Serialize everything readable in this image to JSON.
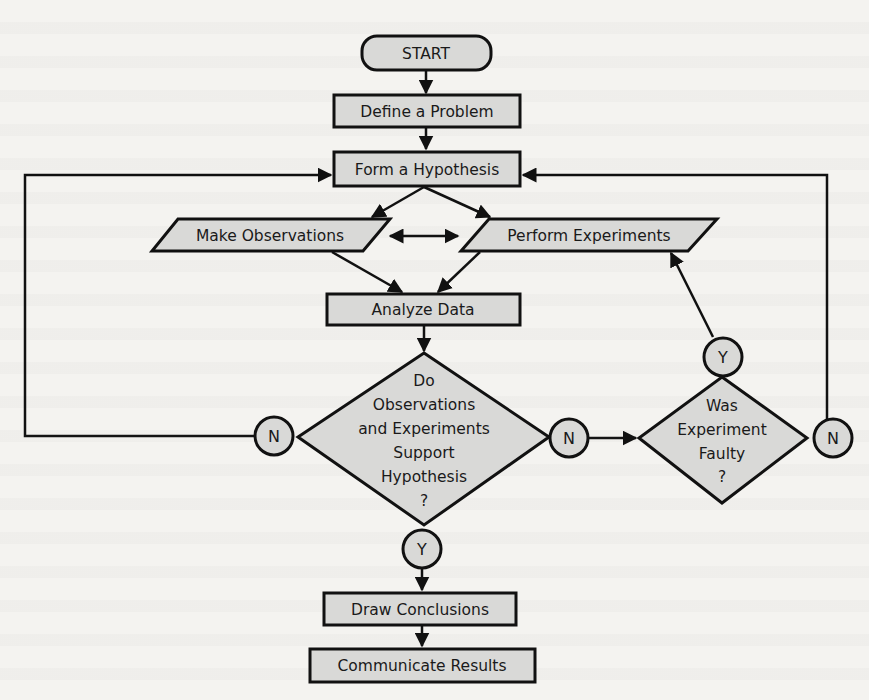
{
  "diagram": {
    "colors": {
      "background": "#f4f3f0",
      "shape_fill": "#d9d9d7",
      "stroke": "#111111"
    },
    "nodes": {
      "start": "START",
      "define": "Define a Problem",
      "hypothesis": "Form a Hypothesis",
      "observations": "Make Observations",
      "experiments": "Perform Experiments",
      "analyze": "Analyze Data",
      "decision_support": [
        "Do",
        "Observations",
        "and Experiments",
        "Support",
        "Hypothesis",
        "?"
      ],
      "decision_faulty": [
        "Was",
        "Experiment",
        "Faulty",
        "?"
      ],
      "conclusions": "Draw Conclusions",
      "communicate": "Communicate Results"
    },
    "connectors": {
      "support_no_left": "N",
      "support_no_right": "N",
      "support_yes": "Y",
      "faulty_yes": "Y",
      "faulty_no": "N"
    }
  }
}
